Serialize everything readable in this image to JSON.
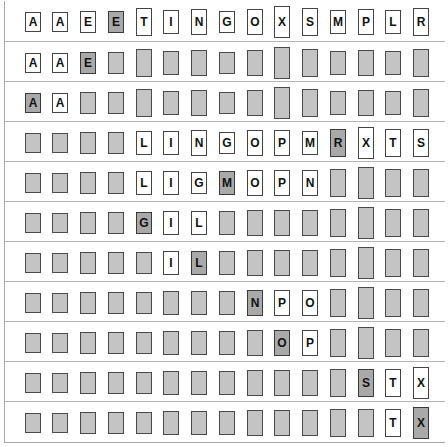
{
  "diagram": {
    "colors": {
      "active": "#ffffff",
      "inactive": "#c4c4c4",
      "highlight": "#a9a9a9",
      "border": "#444444"
    },
    "key_heights": {
      "A": 20,
      "E": 22,
      "G": 22,
      "I": 24,
      "L": 24,
      "M": 24,
      "N": 26,
      "O": 26,
      "P": 26,
      "R": 28,
      "S": 28,
      "T": 28,
      "X": 32
    },
    "rows": [
      {
        "cells": [
          {
            "k": "A",
            "s": "white",
            "show": true
          },
          {
            "k": "A",
            "s": "white",
            "show": true
          },
          {
            "k": "E",
            "s": "white",
            "show": true
          },
          {
            "k": "E",
            "s": "mark",
            "show": true
          },
          {
            "k": "T",
            "s": "white",
            "show": true
          },
          {
            "k": "I",
            "s": "white",
            "show": true
          },
          {
            "k": "N",
            "s": "white",
            "show": true
          },
          {
            "k": "G",
            "s": "white",
            "show": true
          },
          {
            "k": "O",
            "s": "white",
            "show": true
          },
          {
            "k": "X",
            "s": "white",
            "show": true
          },
          {
            "k": "S",
            "s": "white",
            "show": true
          },
          {
            "k": "M",
            "s": "white",
            "show": true
          },
          {
            "k": "P",
            "s": "white",
            "show": true
          },
          {
            "k": "L",
            "s": "white",
            "show": true
          },
          {
            "k": "R",
            "s": "white",
            "show": true
          }
        ]
      },
      {
        "cells": [
          {
            "k": "A",
            "s": "white",
            "show": true
          },
          {
            "k": "A",
            "s": "white",
            "show": true
          },
          {
            "k": "E",
            "s": "mark",
            "show": true
          },
          {
            "k": "E",
            "s": "gray",
            "show": false
          },
          {
            "k": "T",
            "s": "gray",
            "show": false
          },
          {
            "k": "I",
            "s": "gray",
            "show": false
          },
          {
            "k": "N",
            "s": "gray",
            "show": false
          },
          {
            "k": "G",
            "s": "gray",
            "show": false
          },
          {
            "k": "O",
            "s": "gray",
            "show": false
          },
          {
            "k": "X",
            "s": "gray",
            "show": false
          },
          {
            "k": "S",
            "s": "gray",
            "show": false
          },
          {
            "k": "M",
            "s": "gray",
            "show": false
          },
          {
            "k": "P",
            "s": "gray",
            "show": false
          },
          {
            "k": "L",
            "s": "gray",
            "show": false
          },
          {
            "k": "R",
            "s": "gray",
            "show": false
          }
        ]
      },
      {
        "cells": [
          {
            "k": "A",
            "s": "mark",
            "show": true
          },
          {
            "k": "A",
            "s": "white",
            "show": true
          },
          {
            "k": "E",
            "s": "gray",
            "show": false
          },
          {
            "k": "E",
            "s": "gray",
            "show": false
          },
          {
            "k": "T",
            "s": "gray",
            "show": false
          },
          {
            "k": "I",
            "s": "gray",
            "show": false
          },
          {
            "k": "N",
            "s": "gray",
            "show": false
          },
          {
            "k": "G",
            "s": "gray",
            "show": false
          },
          {
            "k": "O",
            "s": "gray",
            "show": false
          },
          {
            "k": "X",
            "s": "gray",
            "show": false
          },
          {
            "k": "S",
            "s": "gray",
            "show": false
          },
          {
            "k": "M",
            "s": "gray",
            "show": false
          },
          {
            "k": "P",
            "s": "gray",
            "show": false
          },
          {
            "k": "L",
            "s": "gray",
            "show": false
          },
          {
            "k": "R",
            "s": "gray",
            "show": false
          }
        ]
      },
      {
        "cells": [
          {
            "k": "A",
            "s": "gray",
            "show": false
          },
          {
            "k": "A",
            "s": "gray",
            "show": false
          },
          {
            "k": "E",
            "s": "gray",
            "show": false
          },
          {
            "k": "E",
            "s": "gray",
            "show": false
          },
          {
            "k": "L",
            "s": "white",
            "show": true
          },
          {
            "k": "I",
            "s": "white",
            "show": true
          },
          {
            "k": "N",
            "s": "white",
            "show": true
          },
          {
            "k": "G",
            "s": "white",
            "show": true
          },
          {
            "k": "O",
            "s": "white",
            "show": true
          },
          {
            "k": "P",
            "s": "white",
            "show": true
          },
          {
            "k": "M",
            "s": "white",
            "show": true
          },
          {
            "k": "R",
            "s": "mark",
            "show": true
          },
          {
            "k": "X",
            "s": "white",
            "show": true
          },
          {
            "k": "T",
            "s": "white",
            "show": true
          },
          {
            "k": "S",
            "s": "white",
            "show": true
          }
        ]
      },
      {
        "cells": [
          {
            "k": "A",
            "s": "gray",
            "show": false
          },
          {
            "k": "A",
            "s": "gray",
            "show": false
          },
          {
            "k": "E",
            "s": "gray",
            "show": false
          },
          {
            "k": "E",
            "s": "gray",
            "show": false
          },
          {
            "k": "L",
            "s": "white",
            "show": true
          },
          {
            "k": "I",
            "s": "white",
            "show": true
          },
          {
            "k": "G",
            "s": "white",
            "show": true
          },
          {
            "k": "M",
            "s": "mark",
            "show": true
          },
          {
            "k": "O",
            "s": "white",
            "show": true
          },
          {
            "k": "P",
            "s": "white",
            "show": true
          },
          {
            "k": "N",
            "s": "white",
            "show": true
          },
          {
            "k": "R",
            "s": "gray",
            "show": false
          },
          {
            "k": "X",
            "s": "gray",
            "show": false
          },
          {
            "k": "T",
            "s": "gray",
            "show": false
          },
          {
            "k": "S",
            "s": "gray",
            "show": false
          }
        ]
      },
      {
        "cells": [
          {
            "k": "A",
            "s": "gray",
            "show": false
          },
          {
            "k": "A",
            "s": "gray",
            "show": false
          },
          {
            "k": "E",
            "s": "gray",
            "show": false
          },
          {
            "k": "E",
            "s": "gray",
            "show": false
          },
          {
            "k": "G",
            "s": "mark",
            "show": true
          },
          {
            "k": "I",
            "s": "white",
            "show": true
          },
          {
            "k": "L",
            "s": "white",
            "show": true
          },
          {
            "k": "M",
            "s": "gray",
            "show": false
          },
          {
            "k": "O",
            "s": "gray",
            "show": false
          },
          {
            "k": "P",
            "s": "gray",
            "show": false
          },
          {
            "k": "N",
            "s": "gray",
            "show": false
          },
          {
            "k": "R",
            "s": "gray",
            "show": false
          },
          {
            "k": "X",
            "s": "gray",
            "show": false
          },
          {
            "k": "T",
            "s": "gray",
            "show": false
          },
          {
            "k": "S",
            "s": "gray",
            "show": false
          }
        ]
      },
      {
        "cells": [
          {
            "k": "A",
            "s": "gray",
            "show": false
          },
          {
            "k": "A",
            "s": "gray",
            "show": false
          },
          {
            "k": "E",
            "s": "gray",
            "show": false
          },
          {
            "k": "E",
            "s": "gray",
            "show": false
          },
          {
            "k": "G",
            "s": "gray",
            "show": false
          },
          {
            "k": "I",
            "s": "white",
            "show": true
          },
          {
            "k": "L",
            "s": "mark",
            "show": true
          },
          {
            "k": "M",
            "s": "gray",
            "show": false
          },
          {
            "k": "O",
            "s": "gray",
            "show": false
          },
          {
            "k": "P",
            "s": "gray",
            "show": false
          },
          {
            "k": "N",
            "s": "gray",
            "show": false
          },
          {
            "k": "R",
            "s": "gray",
            "show": false
          },
          {
            "k": "X",
            "s": "gray",
            "show": false
          },
          {
            "k": "T",
            "s": "gray",
            "show": false
          },
          {
            "k": "S",
            "s": "gray",
            "show": false
          }
        ]
      },
      {
        "cells": [
          {
            "k": "A",
            "s": "gray",
            "show": false
          },
          {
            "k": "A",
            "s": "gray",
            "show": false
          },
          {
            "k": "E",
            "s": "gray",
            "show": false
          },
          {
            "k": "E",
            "s": "gray",
            "show": false
          },
          {
            "k": "G",
            "s": "gray",
            "show": false
          },
          {
            "k": "I",
            "s": "gray",
            "show": false
          },
          {
            "k": "L",
            "s": "gray",
            "show": false
          },
          {
            "k": "M",
            "s": "gray",
            "show": false
          },
          {
            "k": "N",
            "s": "mark",
            "show": true
          },
          {
            "k": "P",
            "s": "white",
            "show": true
          },
          {
            "k": "O",
            "s": "white",
            "show": true
          },
          {
            "k": "R",
            "s": "gray",
            "show": false
          },
          {
            "k": "X",
            "s": "gray",
            "show": false
          },
          {
            "k": "T",
            "s": "gray",
            "show": false
          },
          {
            "k": "S",
            "s": "gray",
            "show": false
          }
        ]
      },
      {
        "cells": [
          {
            "k": "A",
            "s": "gray",
            "show": false
          },
          {
            "k": "A",
            "s": "gray",
            "show": false
          },
          {
            "k": "E",
            "s": "gray",
            "show": false
          },
          {
            "k": "E",
            "s": "gray",
            "show": false
          },
          {
            "k": "G",
            "s": "gray",
            "show": false
          },
          {
            "k": "I",
            "s": "gray",
            "show": false
          },
          {
            "k": "L",
            "s": "gray",
            "show": false
          },
          {
            "k": "M",
            "s": "gray",
            "show": false
          },
          {
            "k": "N",
            "s": "gray",
            "show": false
          },
          {
            "k": "O",
            "s": "mark",
            "show": true
          },
          {
            "k": "P",
            "s": "white",
            "show": true
          },
          {
            "k": "R",
            "s": "gray",
            "show": false
          },
          {
            "k": "X",
            "s": "gray",
            "show": false
          },
          {
            "k": "T",
            "s": "gray",
            "show": false
          },
          {
            "k": "S",
            "s": "gray",
            "show": false
          }
        ]
      },
      {
        "cells": [
          {
            "k": "A",
            "s": "gray",
            "show": false
          },
          {
            "k": "A",
            "s": "gray",
            "show": false
          },
          {
            "k": "E",
            "s": "gray",
            "show": false
          },
          {
            "k": "E",
            "s": "gray",
            "show": false
          },
          {
            "k": "G",
            "s": "gray",
            "show": false
          },
          {
            "k": "I",
            "s": "gray",
            "show": false
          },
          {
            "k": "L",
            "s": "gray",
            "show": false
          },
          {
            "k": "M",
            "s": "gray",
            "show": false
          },
          {
            "k": "N",
            "s": "gray",
            "show": false
          },
          {
            "k": "O",
            "s": "gray",
            "show": false
          },
          {
            "k": "P",
            "s": "gray",
            "show": false
          },
          {
            "k": "R",
            "s": "gray",
            "show": false
          },
          {
            "k": "S",
            "s": "mark",
            "show": true
          },
          {
            "k": "T",
            "s": "white",
            "show": true
          },
          {
            "k": "X",
            "s": "white",
            "show": true
          }
        ]
      },
      {
        "cells": [
          {
            "k": "A",
            "s": "gray",
            "show": false
          },
          {
            "k": "A",
            "s": "gray",
            "show": false
          },
          {
            "k": "E",
            "s": "gray",
            "show": false
          },
          {
            "k": "E",
            "s": "gray",
            "show": false
          },
          {
            "k": "G",
            "s": "gray",
            "show": false
          },
          {
            "k": "I",
            "s": "gray",
            "show": false
          },
          {
            "k": "L",
            "s": "gray",
            "show": false
          },
          {
            "k": "M",
            "s": "gray",
            "show": false
          },
          {
            "k": "N",
            "s": "gray",
            "show": false
          },
          {
            "k": "O",
            "s": "gray",
            "show": false
          },
          {
            "k": "P",
            "s": "gray",
            "show": false
          },
          {
            "k": "R",
            "s": "gray",
            "show": false
          },
          {
            "k": "S",
            "s": "gray",
            "show": false
          },
          {
            "k": "T",
            "s": "white",
            "show": true
          },
          {
            "k": "X",
            "s": "mark",
            "show": true
          }
        ]
      }
    ]
  }
}
